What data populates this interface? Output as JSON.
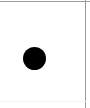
{
  "figure": {
    "title": "",
    "background_color": "#ffffff",
    "width_px": 90,
    "height_px": 108
  },
  "borders": {
    "top": {
      "label": "",
      "color": "#9a9a9a",
      "thickness_px": 1,
      "visible": true
    },
    "right": {
      "label": "",
      "color": "#9a9a9a",
      "thickness_px": 1,
      "visible": true
    },
    "bottom": {
      "label": "",
      "color": "#f4f4f6",
      "thickness_px": 1,
      "visible": true
    },
    "left": {
      "label": "",
      "color": "#ffffff",
      "thickness_px": 0,
      "visible": false
    }
  },
  "chart_data": {
    "type": "scatter",
    "title": "",
    "xlabel": "",
    "ylabel": "",
    "grid": false,
    "legend": null,
    "xlim": [
      0,
      90
    ],
    "ylim": [
      0,
      108
    ],
    "series": [
      {
        "name": "marker",
        "marker": "filled-circle",
        "color": "#000000",
        "size_px": 23,
        "points": [
          {
            "x": 34.5,
            "y": 58.5
          }
        ]
      }
    ],
    "tick_labels": {
      "x": [],
      "y": []
    },
    "annotations": []
  },
  "marker": {
    "shape_name": "filled-circle",
    "color": "#000000",
    "diameter_px": 23,
    "center_x_px": 34.5,
    "center_y_px": 58.5,
    "label": ""
  }
}
